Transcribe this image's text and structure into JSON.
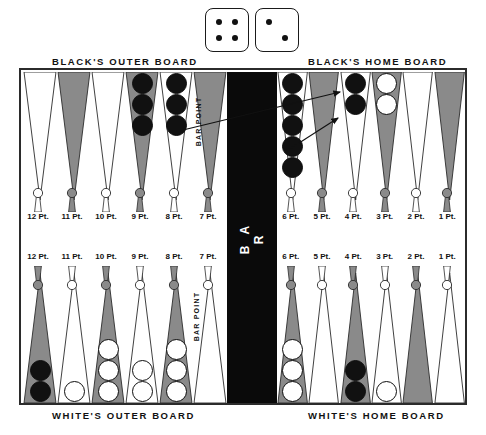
{
  "dice": {
    "name": "backgammon-dice",
    "left_die": {
      "value": 4,
      "pips": [
        [
          0.3,
          0.3
        ],
        [
          0.7,
          0.3
        ],
        [
          0.3,
          0.7
        ],
        [
          0.7,
          0.7
        ]
      ]
    },
    "right_die": {
      "value": 2,
      "pips": [
        [
          0.3,
          0.3
        ],
        [
          0.7,
          0.7
        ]
      ]
    }
  },
  "headings": {
    "black_outer": "BLACK'S OUTER BOARD",
    "black_home": "BLACK'S HOME BOARD",
    "white_outer": "WHITE'S OUTER BOARD",
    "white_home": "WHITE'S HOME BOARD"
  },
  "bar": {
    "label": "B A R",
    "barpoint_top": "BAR POINT",
    "barpoint_bottom": "BAR POINT"
  },
  "colors": {
    "shaded_point": "#8a8a8a",
    "light_point": "#ffffff",
    "outline": "#2b2b2b",
    "black_checker": "#111111",
    "white_checker": "#ffffff",
    "bar_fill": "#0a0a0a"
  },
  "labels": {
    "top_left": [
      "12 Pt.",
      "11 Pt.",
      "10 Pt.",
      "9 Pt.",
      "8 Pt.",
      "7 Pt."
    ],
    "top_right": [
      "6 Pt.",
      "5 Pt.",
      "4 Pt.",
      "3 Pt.",
      "2 Pt.",
      "1 Pt."
    ],
    "bottom_left": [
      "12 Pt.",
      "11 Pt.",
      "10 Pt.",
      "9 Pt.",
      "8 Pt.",
      "7 Pt."
    ],
    "bottom_right": [
      "6 Pt.",
      "5 Pt.",
      "4 Pt.",
      "3 Pt.",
      "2 Pt.",
      "1 Pt."
    ]
  },
  "chart_data": {
    "type": "table",
    "quadrants": {
      "top_left": {
        "name": "BLACK'S OUTER BOARD",
        "points": [
          {
            "label": "12 Pt.",
            "shade": "light",
            "checkers": 0,
            "color": ""
          },
          {
            "label": "11 Pt.",
            "shade": "shaded",
            "checkers": 0,
            "color": ""
          },
          {
            "label": "10 Pt.",
            "shade": "light",
            "checkers": 0,
            "color": ""
          },
          {
            "label": "9 Pt.",
            "shade": "shaded",
            "checkers": 3,
            "color": "black"
          },
          {
            "label": "8 Pt.",
            "shade": "light",
            "checkers": 3,
            "color": "black"
          },
          {
            "label": "7 Pt.",
            "shade": "shaded",
            "checkers": 0,
            "color": ""
          }
        ]
      },
      "top_right": {
        "name": "BLACK'S HOME BOARD",
        "points": [
          {
            "label": "6 Pt.",
            "shade": "light",
            "checkers": 5,
            "color": "black"
          },
          {
            "label": "5 Pt.",
            "shade": "shaded",
            "checkers": 0,
            "color": ""
          },
          {
            "label": "4 Pt.",
            "shade": "light",
            "checkers": 2,
            "color": "black"
          },
          {
            "label": "3 Pt.",
            "shade": "shaded",
            "checkers": 2,
            "color": "white"
          },
          {
            "label": "2 Pt.",
            "shade": "light",
            "checkers": 0,
            "color": ""
          },
          {
            "label": "1 Pt.",
            "shade": "shaded",
            "checkers": 0,
            "color": ""
          }
        ]
      },
      "bottom_left": {
        "name": "WHITE'S OUTER BOARD",
        "points": [
          {
            "label": "12 Pt.",
            "shade": "shaded",
            "checkers": 2,
            "color": "black"
          },
          {
            "label": "11 Pt.",
            "shade": "light",
            "checkers": 1,
            "color": "white"
          },
          {
            "label": "10 Pt.",
            "shade": "shaded",
            "checkers": 3,
            "color": "white"
          },
          {
            "label": "9 Pt.",
            "shade": "light",
            "checkers": 2,
            "color": "white"
          },
          {
            "label": "8 Pt.",
            "shade": "shaded",
            "checkers": 3,
            "color": "white"
          },
          {
            "label": "7 Pt.",
            "shade": "light",
            "checkers": 0,
            "color": ""
          }
        ]
      },
      "bottom_right": {
        "name": "WHITE'S HOME BOARD",
        "points": [
          {
            "label": "6 Pt.",
            "shade": "shaded",
            "checkers": 3,
            "color": "white"
          },
          {
            "label": "5 Pt.",
            "shade": "light",
            "checkers": 0,
            "color": ""
          },
          {
            "label": "4 Pt.",
            "shade": "shaded",
            "checkers": 2,
            "color": "black"
          },
          {
            "label": "3 Pt.",
            "shade": "light",
            "checkers": 1,
            "color": "white"
          },
          {
            "label": "2 Pt.",
            "shade": "shaded",
            "checkers": 0,
            "color": ""
          },
          {
            "label": "1 Pt.",
            "shade": "light",
            "checkers": 0,
            "color": ""
          }
        ]
      }
    },
    "move_arrows": [
      {
        "from": "8 Pt. (black outer)",
        "to": "4 Pt. (black home)",
        "x1": 183,
        "y1": 130,
        "x2": 340,
        "y2": 92
      },
      {
        "from": "6 Pt. (black home)",
        "to": "4 Pt. (black home)",
        "x1": 285,
        "y1": 152,
        "x2": 338,
        "y2": 118
      }
    ]
  }
}
